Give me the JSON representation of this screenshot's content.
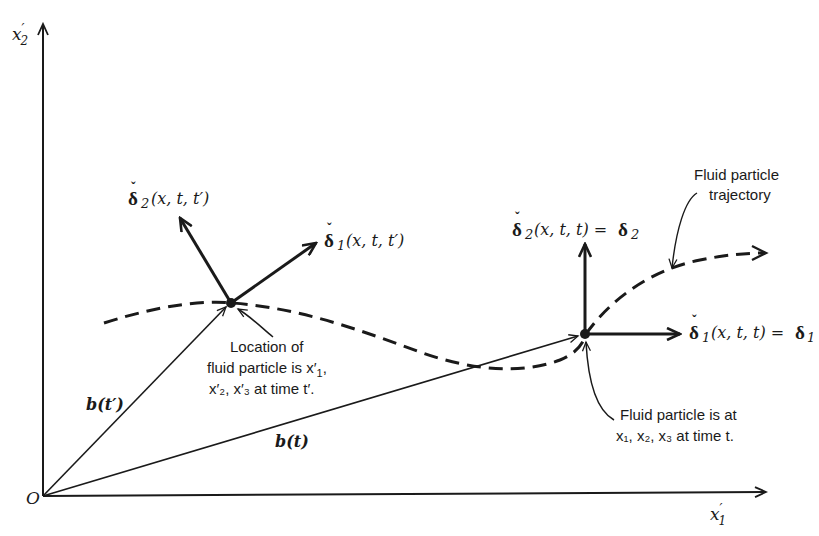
{
  "axes": {
    "origin_label": "O",
    "x_axis_label": "x",
    "x_axis_prime": "′",
    "x_axis_sub": "1",
    "y_axis_label": "x",
    "y_axis_prime": "′",
    "y_axis_sub": "2"
  },
  "vectors": {
    "b_t_prime": "b(t′)",
    "b_t": "b(t)"
  },
  "point_t_prime": {
    "delta2_symbol": "δ",
    "delta2_sub": "2",
    "delta2_args": "(x, t, t′)",
    "delta1_symbol": "δ",
    "delta1_sub": "1",
    "delta1_args": "(x, t, t′)",
    "caption_line1": "Location of",
    "caption_line2": "fluid particle is x′",
    "caption_line2_sub": "1",
    "caption_line2_end": ",",
    "caption_line3": "x′₂, x′₃ at time t′."
  },
  "point_t": {
    "delta2_symbol": "δ",
    "delta2_sub": "2",
    "delta2_args": "(x, t, t) = ",
    "delta2_rhs": "δ",
    "delta2_rhs_sub": "2",
    "delta1_symbol": "δ",
    "delta1_sub": "1",
    "delta1_args": "(x, t, t) = ",
    "delta1_rhs": "δ",
    "delta1_rhs_sub": "1",
    "caption_line1": "Fluid particle is at",
    "caption_line2": "x₁, x₂, x₃ at time t."
  },
  "trajectory": {
    "label_line1": "Fluid particle",
    "label_line2": "trajectory"
  },
  "accent_symbol": "ˇ"
}
